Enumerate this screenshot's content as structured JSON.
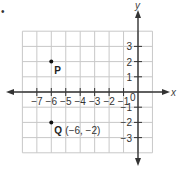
{
  "bullet": "•",
  "axes": {
    "x_label": "x",
    "y_label": "y",
    "origin_label": "0",
    "x_ticks": [
      {
        "value": -7,
        "label": "−7"
      },
      {
        "value": -6,
        "label": "−6"
      },
      {
        "value": -5,
        "label": "−5"
      },
      {
        "value": -4,
        "label": "−4"
      },
      {
        "value": -3,
        "label": "−3"
      },
      {
        "value": -2,
        "label": "−2"
      },
      {
        "value": -1,
        "label": "−1"
      }
    ],
    "y_ticks": [
      {
        "value": 3,
        "label": "3"
      },
      {
        "value": 2,
        "label": "2"
      },
      {
        "value": 1,
        "label": "1"
      },
      {
        "value": -1,
        "label": "−1"
      },
      {
        "value": -2,
        "label": "−2"
      },
      {
        "value": -3,
        "label": "−3"
      }
    ]
  },
  "points": [
    {
      "name": "P",
      "x": -6,
      "y": 2,
      "label": "P",
      "coords_label": ""
    },
    {
      "name": "Q",
      "x": -6,
      "y": -2,
      "label": "Q",
      "coords_label": "(−6, −2)"
    }
  ],
  "grid": {
    "x_min": -8,
    "x_max": 1,
    "y_min": -4,
    "y_max": 4
  },
  "colors": {
    "grid": "#c8c8c8",
    "axis": "#333333",
    "point": "#111111"
  },
  "chart_data": {
    "type": "scatter",
    "title": "",
    "xlabel": "x",
    "ylabel": "y",
    "xlim": [
      -8,
      1
    ],
    "ylim": [
      -4,
      4
    ],
    "grid": true,
    "points": [
      {
        "label": "P",
        "x": -6,
        "y": 2
      },
      {
        "label": "Q",
        "x": -6,
        "y": -2,
        "annotation": "(−6, −2)"
      }
    ],
    "x_tick_labels": [
      "−7",
      "−6",
      "−5",
      "−4",
      "−3",
      "−2",
      "−1"
    ],
    "y_tick_labels": [
      "3",
      "2",
      "1",
      "−1",
      "−2",
      "−3"
    ]
  }
}
